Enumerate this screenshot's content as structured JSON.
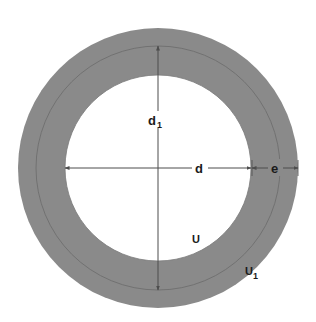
{
  "figure": {
    "type": "technical-drawing",
    "background_color": "#ffffff",
    "ring_fill_color": "#8a8a8a",
    "line_color": "#4d4d4d",
    "text_color": "#1a1a1a",
    "center": {
      "x": 158,
      "y": 168
    },
    "geometry": {
      "outer_radius": 140,
      "middle_radius": 122,
      "inner_radius": 93
    }
  },
  "labels": {
    "inner_diameter": {
      "base": "d",
      "sub": "1"
    },
    "middle_diameter": {
      "base": "d",
      "sub": ""
    },
    "ring_thickness": {
      "base": "e",
      "sub": ""
    },
    "inner_circumference": {
      "base": "U",
      "sub": ""
    },
    "middle_circumference": {
      "base": "U",
      "sub": "1"
    }
  },
  "annotations": {
    "vertical_dimension_name": "d1-vertical-dimension",
    "horizontal_dimension_name": "d-horizontal-dimension",
    "thickness_dimension_name": "e-thickness-dimension"
  }
}
